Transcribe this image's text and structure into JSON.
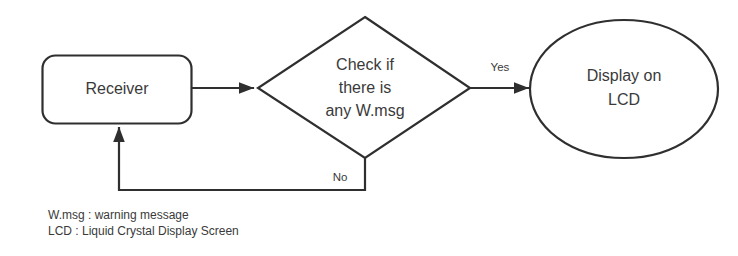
{
  "diagram": {
    "background_color": "#ffffff",
    "stroke_color": "#2f2f2f",
    "text_color": "#3a3a3a",
    "nodes": {
      "receiver": {
        "label": "Receiver",
        "shape": "rounded-rectangle"
      },
      "decision": {
        "shape": "diamond",
        "line1": "Check if",
        "line2": "there is",
        "line3": "any W.msg"
      },
      "display": {
        "shape": "ellipse",
        "line1": "Display on",
        "line2": "LCD"
      }
    },
    "edges": {
      "receiver_to_decision": {
        "label": ""
      },
      "decision_to_display": {
        "label": "Yes"
      },
      "decision_to_receiver": {
        "label": "No"
      }
    },
    "legend": {
      "line1": "W.msg : warning message",
      "line2": "LCD : Liquid Crystal Display Screen"
    }
  }
}
